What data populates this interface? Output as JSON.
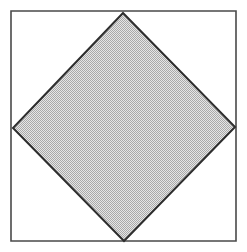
{
  "figure": {
    "kind": "geometry-diagram",
    "canvas": {
      "width": 247,
      "height": 252,
      "background_color": "#ffffff"
    },
    "outer_square": {
      "label": "outer square",
      "x": 11,
      "y": 11,
      "width": 225,
      "height": 230,
      "stroke_color": "#4a4a4a",
      "stroke_width": 1.6,
      "fill_color": "none",
      "points": "11,11 236,11 236,241 11,241"
    },
    "inner_diamond": {
      "label": "inscribed square (diamond)",
      "stroke_color": "#2e2e2e",
      "stroke_width": 2.0,
      "fill_color": "#c9c9c9",
      "fill_pattern": "halftone-dither",
      "points": "123,13 235,127 124,241 13,128",
      "vertices": [
        {
          "name": "top-vertex",
          "x": 123,
          "y": 13
        },
        {
          "name": "right-vertex",
          "x": 235,
          "y": 127
        },
        {
          "name": "bottom-vertex",
          "x": 124,
          "y": 241
        },
        {
          "name": "left-vertex",
          "x": 13,
          "y": 128
        }
      ]
    },
    "labels": []
  }
}
